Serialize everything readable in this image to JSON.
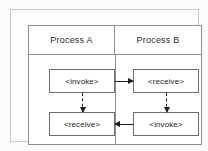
{
  "diagram": {
    "lanes": [
      {
        "id": "process-a",
        "header": "Process A",
        "activities": [
          {
            "id": "a-invoke",
            "label": "<invoke>",
            "position": "top"
          },
          {
            "id": "a-receive",
            "label": "<receive>",
            "position": "bottom"
          }
        ]
      },
      {
        "id": "process-b",
        "header": "Process B",
        "activities": [
          {
            "id": "b-receive",
            "label": "<receive>",
            "position": "top"
          },
          {
            "id": "b-invoke",
            "label": "<invoke>",
            "position": "bottom"
          }
        ]
      }
    ],
    "connectors": [
      {
        "id": "request-message",
        "style": "solid",
        "orientation": "horizontal",
        "direction": "right",
        "from": "a-invoke",
        "to": "b-receive"
      },
      {
        "id": "response-message",
        "style": "solid",
        "orientation": "horizontal",
        "direction": "left",
        "from": "b-invoke",
        "to": "a-receive"
      },
      {
        "id": "sequence-a",
        "style": "dashed",
        "orientation": "vertical",
        "direction": "down",
        "from": "a-invoke",
        "to": "a-receive"
      },
      {
        "id": "sequence-b",
        "style": "dashed",
        "orientation": "vertical",
        "direction": "down",
        "from": "b-receive",
        "to": "b-invoke"
      }
    ],
    "colors": {
      "page_background": "#fbfbfb",
      "frame_outer_border": "#c9c9c9",
      "frame_inner_border": "#8f8f8f",
      "box_border": "#6e6e6e",
      "box_fill": "#ffffff",
      "connector": "#1d1d1d",
      "text": "#1d1d1d"
    }
  }
}
